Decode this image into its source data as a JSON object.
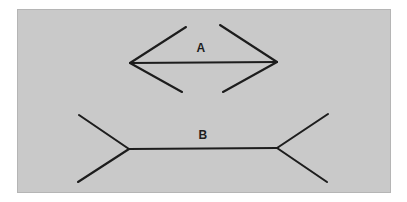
{
  "figure": {
    "kind": "muller-lyer-illusion",
    "panel": {
      "background_color": "#c9c9c9",
      "border_color": "#b5b5b5",
      "page_background_color": "#ffffff",
      "x": 17,
      "y": 9,
      "width": 374,
      "height": 184
    },
    "stroke": {
      "color": "#1d1d1d",
      "width": 2.1
    },
    "labels": [
      {
        "name": "label-a",
        "text": "A",
        "x": 183,
        "y": 38
      },
      {
        "name": "label-b",
        "text": "B",
        "x": 185,
        "y": 125
      }
    ],
    "figures": [
      {
        "id": "A",
        "label": "A",
        "fin_direction": "inward",
        "description": "Horizontal shaft with inward-pointing arrowheads at both ends (appears shorter).",
        "shaft": {
          "x1": 112,
          "y1": 53,
          "x2": 259,
          "y2": 52
        },
        "fins": [
          {
            "name": "fin-a-top-left",
            "x1": 112,
            "y1": 53,
            "x2": 168,
            "y2": 17
          },
          {
            "name": "fin-a-bottom-left",
            "x1": 112,
            "y1": 53,
            "x2": 164,
            "y2": 82
          },
          {
            "name": "fin-a-top-right",
            "x1": 259,
            "y1": 52,
            "x2": 202,
            "y2": 15
          },
          {
            "name": "fin-a-bottom-right",
            "x1": 259,
            "y1": 52,
            "x2": 205,
            "y2": 82
          }
        ]
      },
      {
        "id": "B",
        "label": "B",
        "fin_direction": "outward",
        "description": "Horizontal shaft of equal length with outward-pointing fins at both ends (appears longer).",
        "shaft": {
          "x1": 111,
          "y1": 139,
          "x2": 259,
          "y2": 138
        },
        "fins": [
          {
            "name": "fin-b-top-left",
            "x1": 111,
            "y1": 139,
            "x2": 61,
            "y2": 105
          },
          {
            "name": "fin-b-bottom-left",
            "x1": 111,
            "y1": 139,
            "x2": 60,
            "y2": 172
          },
          {
            "name": "fin-b-top-right",
            "x1": 259,
            "y1": 138,
            "x2": 310,
            "y2": 104
          },
          {
            "name": "fin-b-bottom-right",
            "x1": 259,
            "y1": 138,
            "x2": 309,
            "y2": 172
          }
        ]
      }
    ]
  },
  "chart_data": {
    "type": "line",
    "title": "",
    "xlabel": "",
    "ylabel": "",
    "grid": false,
    "legend_position": "none",
    "series": [
      {
        "name": "A",
        "shaft_length_px": 147,
        "fin_direction": "inward",
        "points": [
          [
            112,
            53
          ],
          [
            259,
            52
          ]
        ]
      },
      {
        "name": "B",
        "shaft_length_px": 148,
        "fin_direction": "outward",
        "points": [
          [
            111,
            139
          ],
          [
            259,
            138
          ]
        ]
      }
    ],
    "annotations": [
      "A",
      "B"
    ]
  }
}
